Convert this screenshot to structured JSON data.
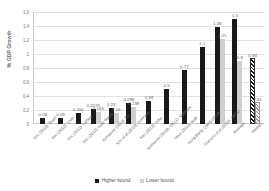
{
  "chart_data": {
    "type": "bar",
    "title": "",
    "xlabel": "",
    "ylabel": "% GDP Growth",
    "ylim": [
      0,
      1.6
    ],
    "yticks": [
      "0",
      "0.2",
      "0.4",
      "0.6",
      "0.8",
      "1",
      "1.2",
      "1.4",
      "1.6"
    ],
    "grid": true,
    "legend_position": "bottom",
    "categories": [
      "Kec (2012), Brazil",
      "Kec (2012), Chile",
      "Kec (2012), LATAM",
      "Kec (2012), Arab States",
      "Kolmanov (2019), EU",
      "Kec et al (2019), Germany",
      "Kec (2012), India",
      "Kolmanov (2019), OECD, Malaysia",
      "Nour (2019), Arab",
      "Hong Bang, Qiang (2018)",
      "Gianone et al (2019), OECD",
      "Average",
      "Median"
    ],
    "series": [
      {
        "name": "Higher bound",
        "values": [
          0.08,
          0.09,
          0.156,
          0.2075,
          0.23,
          0.296,
          0.33,
          0.5,
          0.77,
          1.1,
          1.38,
          1.5,
          0.94
        ]
      },
      {
        "name": "Lower bound",
        "values": [
          null,
          null,
          null,
          0.165,
          0.16,
          0.238,
          null,
          null,
          null,
          null,
          1.21,
          0.9,
          0.31
        ]
      }
    ],
    "colors": {
      "higher_bound": "#1a1a1a",
      "lower_bound": "#cfcfcf",
      "gridline": "#e2e2e2",
      "axis": "#c9c9c9",
      "text": "#6b6b6b"
    }
  },
  "legend": {
    "items": [
      {
        "label": "Higher bound",
        "swatch": "hi"
      },
      {
        "label": "Lower bound",
        "swatch": "lo"
      }
    ]
  },
  "bar_groups": [
    {
      "cat": "Kec (2012), Brazil",
      "hi": 0.08,
      "hi_label": "0.08",
      "lo": null,
      "lo_label": "",
      "hi_style": "hi",
      "lo_style": "lo"
    },
    {
      "cat": "Kec (2012), Chile",
      "hi": 0.09,
      "hi_label": "0.09",
      "lo": null,
      "lo_label": "",
      "hi_style": "hi",
      "lo_style": "lo"
    },
    {
      "cat": "Kec (2012), LATAM",
      "hi": 0.156,
      "hi_label": "0.156",
      "lo": null,
      "lo_label": "",
      "hi_style": "hi",
      "lo_style": "lo"
    },
    {
      "cat": "Kec (2012), Arab States",
      "hi": 0.2075,
      "hi_label": "0.2075",
      "lo": 0.165,
      "lo_label": "0.165",
      "hi_style": "hi",
      "lo_style": "lo"
    },
    {
      "cat": "Kolmanov (2019), EU",
      "hi": 0.23,
      "hi_label": "0.23",
      "lo": 0.16,
      "lo_label": "0.16",
      "hi_style": "hi",
      "lo_style": "lo"
    },
    {
      "cat": "Kec et al (2019), Germany",
      "hi": 0.296,
      "hi_label": "0.296",
      "lo": 0.238,
      "lo_label": "0.238",
      "hi_style": "hi",
      "lo_style": "lo"
    },
    {
      "cat": "Kec (2012), India",
      "hi": 0.33,
      "hi_label": "0.33",
      "lo": null,
      "lo_label": "",
      "hi_style": "hi",
      "lo_style": "lo"
    },
    {
      "cat": "Kolmanov (2019), OECD, Malaysia",
      "hi": 0.5,
      "hi_label": "0.5",
      "lo": null,
      "lo_label": "",
      "hi_style": "hi",
      "lo_style": "lo"
    },
    {
      "cat": "Nour (2019), Arab",
      "hi": 0.77,
      "hi_label": "0.77",
      "lo": null,
      "lo_label": "",
      "hi_style": "hi",
      "lo_style": "lo"
    },
    {
      "cat": "Hong Bang, Qiang (2018)",
      "hi": 1.1,
      "hi_label": "1.1",
      "lo": null,
      "lo_label": "",
      "hi_style": "hi",
      "lo_style": "lo"
    },
    {
      "cat": "Gianone et al (2019), OECD",
      "hi": 1.38,
      "hi_label": "1.38",
      "lo": 1.21,
      "lo_label": "1.21",
      "hi_style": "hi",
      "lo_style": "lo"
    },
    {
      "cat": "Average",
      "hi": 1.5,
      "hi_label": "1.5",
      "lo": 0.9,
      "lo_label": "0.9",
      "hi_style": "hi",
      "lo_style": "lo"
    },
    {
      "cat": "Median",
      "hi": 0.94,
      "hi_label": "0.94",
      "lo": 0.31,
      "lo_label": "0.31",
      "hi_style": "hatch-dark",
      "lo_style": "hatch-light"
    }
  ]
}
